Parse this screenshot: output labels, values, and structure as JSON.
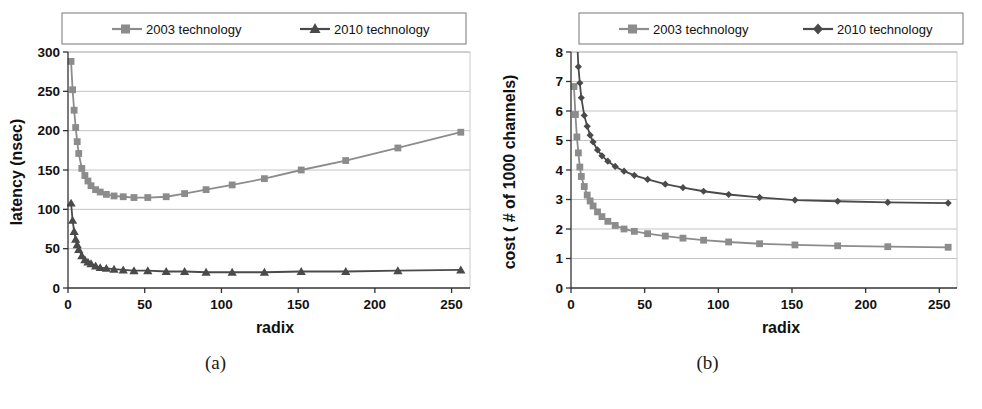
{
  "figure": {
    "panels": [
      {
        "caption": "(a)",
        "legend": {
          "entries": [
            {
              "label": "2003 technology",
              "marker": "square-marker",
              "color": "#8c8c8c"
            },
            {
              "label": "2010 technology",
              "marker": "triangle-marker",
              "color": "#4a4a4a"
            }
          ]
        },
        "chart_data": {
          "type": "line",
          "title": "",
          "xlabel": "radix",
          "ylabel": "latency (nsec)",
          "xlim": [
            0,
            262
          ],
          "ylim": [
            0,
            300
          ],
          "xticks": [
            0,
            50,
            100,
            150,
            200,
            250
          ],
          "yticks": [
            0,
            50,
            100,
            150,
            200,
            250,
            300
          ],
          "grid": "horizontal",
          "legend_position": "top-outside",
          "x": [
            2,
            3,
            4,
            5,
            6,
            7,
            9,
            11,
            13,
            15,
            18,
            21,
            25,
            30,
            36,
            43,
            52,
            64,
            76,
            90,
            107,
            128,
            152,
            181,
            215,
            256
          ],
          "series": [
            {
              "name": "2003 technology",
              "values": [
                288,
                252,
                226,
                204,
                186,
                171,
                152,
                143,
                136,
                130,
                125,
                122,
                119,
                117,
                116,
                115,
                115,
                116,
                120,
                125,
                131,
                139,
                150,
                162,
                178,
                198
              ]
            },
            {
              "name": "2010 technology",
              "values": [
                108,
                86,
                72,
                62,
                55,
                49,
                41,
                36,
                33,
                31,
                28,
                26,
                25,
                24,
                23,
                22,
                22,
                21,
                21,
                20,
                20,
                20,
                21,
                21,
                22,
                23
              ]
            }
          ]
        }
      },
      {
        "caption": "(b)",
        "legend": {
          "entries": [
            {
              "label": "2003 technology",
              "marker": "square-marker",
              "color": "#8c8c8c"
            },
            {
              "label": "2010 technology",
              "marker": "diamond-marker",
              "color": "#4a4a4a"
            }
          ]
        },
        "chart_data": {
          "type": "line",
          "title": "",
          "xlabel": "radix",
          "ylabel": "cost ( # of 1000 channels)",
          "xlim": [
            0,
            262
          ],
          "ylim": [
            0,
            8
          ],
          "xticks": [
            0,
            50,
            100,
            150,
            200,
            250
          ],
          "yticks": [
            0,
            1,
            2,
            3,
            4,
            5,
            6,
            7,
            8
          ],
          "grid": "horizontal",
          "legend_position": "top-outside",
          "x": [
            2,
            3,
            4,
            5,
            6,
            7,
            9,
            11,
            13,
            15,
            18,
            21,
            25,
            30,
            36,
            43,
            52,
            64,
            76,
            90,
            107,
            128,
            152,
            181,
            215,
            256
          ],
          "series": [
            {
              "name": "2003 technology",
              "values": [
                6.83,
                5.88,
                5.12,
                4.58,
                4.1,
                3.78,
                3.44,
                3.15,
                2.95,
                2.78,
                2.58,
                2.42,
                2.26,
                2.12,
                2.0,
                1.92,
                1.84,
                1.76,
                1.69,
                1.62,
                1.56,
                1.5,
                1.46,
                1.43,
                1.4,
                1.38
              ]
            },
            {
              "name": "2010 technology",
              "values": [
                11.9,
                9.8,
                8.6,
                7.5,
                6.95,
                6.45,
                5.85,
                5.48,
                5.18,
                4.95,
                4.68,
                4.48,
                4.3,
                4.12,
                3.96,
                3.82,
                3.68,
                3.52,
                3.4,
                3.28,
                3.17,
                3.07,
                2.98,
                2.94,
                2.9,
                2.88
              ]
            }
          ]
        }
      }
    ]
  }
}
